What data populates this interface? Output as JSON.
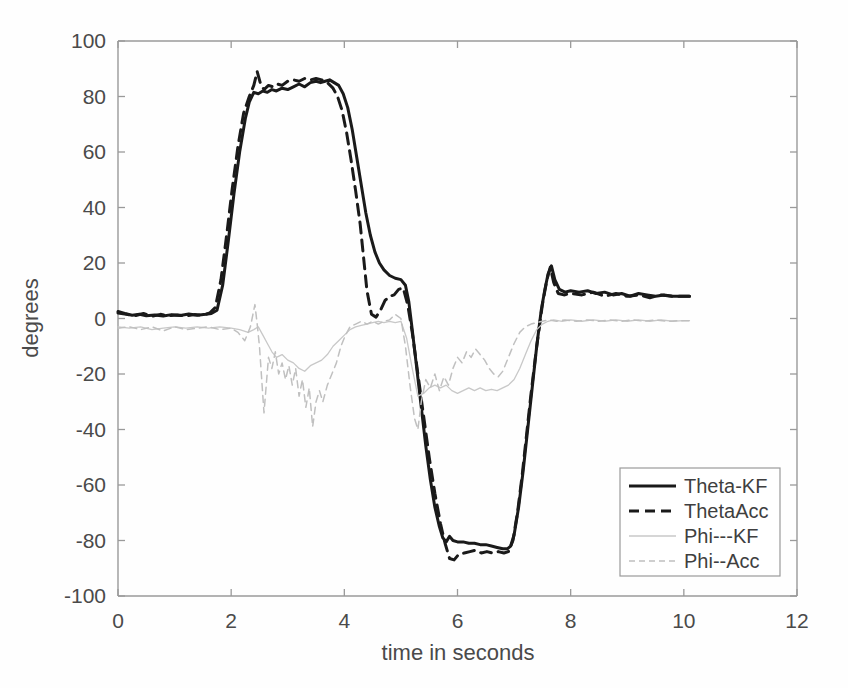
{
  "chart_data": {
    "type": "line",
    "title": "",
    "xlabel": "time in seconds",
    "ylabel": "degrees",
    "xlim": [
      0,
      12
    ],
    "ylim": [
      -100,
      100
    ],
    "xticks": [
      0,
      2,
      4,
      6,
      8,
      10,
      12
    ],
    "yticks": [
      -100,
      -80,
      -60,
      -40,
      -20,
      0,
      20,
      40,
      60,
      80,
      100
    ],
    "xtick_labels": [
      "0",
      "2",
      "4",
      "6",
      "8",
      "10",
      "12"
    ],
    "ytick_labels": [
      "-100",
      "-80",
      "-60",
      "-40",
      "-20",
      "0",
      "20",
      "40",
      "60",
      "80",
      "100"
    ],
    "grid": false,
    "legend_position": "lower right",
    "legend_entries": [
      {
        "label": "Theta-KF",
        "style": "solid",
        "color": "#1a1a1a",
        "width": 3.0
      },
      {
        "label": "ThetaAcc",
        "style": "dashed",
        "color": "#1a1a1a",
        "width": 3.0
      },
      {
        "label": "Phi---KF",
        "style": "solid",
        "color": "#c8c8c8",
        "width": 1.3
      },
      {
        "label": "Phi--Acc",
        "style": "dashed",
        "color": "#c0c0c0",
        "width": 1.5
      }
    ],
    "series": [
      {
        "name": "Theta-KF",
        "style": "solid",
        "color": "#1a1a1a",
        "width": 3.0,
        "x": [
          0.0,
          0.12,
          0.25,
          0.38,
          0.5,
          0.65,
          0.8,
          0.95,
          1.1,
          1.25,
          1.4,
          1.55,
          1.65,
          1.75,
          1.85,
          1.95,
          2.05,
          2.15,
          2.25,
          2.32,
          2.4,
          2.48,
          2.56,
          2.64,
          2.72,
          2.8,
          2.9,
          3.0,
          3.1,
          3.2,
          3.3,
          3.4,
          3.5,
          3.58,
          3.66,
          3.74,
          3.82,
          3.9,
          3.98,
          4.06,
          4.14,
          4.22,
          4.3,
          4.38,
          4.46,
          4.54,
          4.62,
          4.7,
          4.8,
          4.9,
          5.0,
          5.08,
          5.14,
          5.2,
          5.28,
          5.36,
          5.44,
          5.52,
          5.6,
          5.68,
          5.74,
          5.8,
          5.86,
          5.92,
          6.0,
          6.1,
          6.2,
          6.3,
          6.4,
          6.5,
          6.6,
          6.7,
          6.8,
          6.88,
          6.94,
          7.0,
          7.08,
          7.16,
          7.24,
          7.32,
          7.4,
          7.48,
          7.54,
          7.6,
          7.66,
          7.72,
          7.8,
          7.9,
          8.0,
          8.15,
          8.3,
          8.45,
          8.6,
          8.75,
          8.9,
          9.05,
          9.2,
          9.35,
          9.5,
          9.65,
          9.8,
          9.95,
          10.1
        ],
        "y": [
          2.5,
          1.8,
          1.2,
          1.5,
          1.0,
          1.3,
          0.9,
          1.4,
          1.1,
          1.6,
          1.2,
          1.5,
          1.8,
          3.0,
          12.0,
          28.0,
          45.0,
          60.0,
          72.0,
          78.0,
          81.5,
          81.0,
          82.0,
          81.5,
          82.5,
          82.0,
          83.0,
          82.5,
          83.5,
          84.5,
          83.5,
          85.0,
          85.5,
          85.0,
          85.5,
          86.0,
          85.0,
          84.0,
          81.0,
          76.0,
          68.0,
          58.0,
          48.0,
          38.0,
          30.0,
          24.0,
          20.0,
          17.5,
          15.5,
          14.5,
          14.0,
          12.0,
          6.0,
          -4.0,
          -18.0,
          -32.0,
          -46.0,
          -58.0,
          -68.0,
          -75.0,
          -79.0,
          -80.5,
          -78.5,
          -80.0,
          -80.5,
          -80.5,
          -81.0,
          -81.0,
          -81.5,
          -81.5,
          -82.0,
          -82.5,
          -83.0,
          -83.0,
          -82.0,
          -78.0,
          -68.0,
          -55.0,
          -40.0,
          -25.0,
          -10.0,
          3.0,
          10.0,
          16.0,
          19.0,
          14.0,
          10.5,
          9.5,
          10.0,
          9.5,
          10.0,
          9.0,
          9.5,
          8.5,
          9.0,
          8.0,
          9.0,
          8.5,
          8.0,
          8.5,
          8.0,
          8.0,
          8.0
        ]
      },
      {
        "name": "ThetaAcc",
        "style": "dashed",
        "color": "#1a1a1a",
        "width": 3.0,
        "x": [
          0.0,
          0.15,
          0.3,
          0.45,
          0.6,
          0.75,
          0.9,
          1.05,
          1.2,
          1.35,
          1.5,
          1.62,
          1.72,
          1.82,
          1.92,
          2.02,
          2.12,
          2.22,
          2.32,
          2.4,
          2.46,
          2.52,
          2.58,
          2.66,
          2.74,
          2.82,
          2.9,
          3.0,
          3.1,
          3.2,
          3.3,
          3.4,
          3.5,
          3.6,
          3.7,
          3.8,
          3.88,
          3.96,
          4.04,
          4.12,
          4.2,
          4.28,
          4.34,
          4.4,
          4.48,
          4.56,
          4.64,
          4.72,
          4.8,
          4.88,
          4.96,
          5.04,
          5.12,
          5.2,
          5.3,
          5.4,
          5.5,
          5.6,
          5.7,
          5.78,
          5.86,
          5.94,
          6.02,
          6.12,
          6.22,
          6.32,
          6.42,
          6.52,
          6.62,
          6.72,
          6.82,
          6.9,
          6.98,
          7.06,
          7.14,
          7.22,
          7.3,
          7.4,
          7.5,
          7.58,
          7.64,
          7.7,
          7.78,
          7.88,
          8.0,
          8.2,
          8.4,
          8.6,
          8.8,
          9.0,
          9.2,
          9.4,
          9.6,
          9.8,
          10.0,
          10.1
        ],
        "y": [
          2.0,
          1.5,
          1.0,
          1.8,
          0.8,
          1.5,
          1.0,
          1.3,
          0.9,
          1.4,
          1.2,
          2.0,
          4.0,
          14.0,
          30.0,
          47.0,
          62.0,
          74.0,
          80.0,
          84.0,
          89.0,
          84.5,
          82.5,
          84.0,
          83.5,
          84.5,
          84.0,
          85.5,
          86.0,
          85.5,
          86.5,
          86.0,
          86.5,
          86.0,
          85.0,
          83.0,
          80.0,
          75.0,
          67.0,
          57.0,
          46.0,
          34.0,
          22.0,
          10.0,
          1.5,
          0.5,
          3.0,
          6.5,
          8.0,
          8.5,
          10.5,
          11.0,
          5.0,
          -5.0,
          -20.0,
          -35.0,
          -50.0,
          -63.0,
          -74.0,
          -81.0,
          -86.5,
          -87.0,
          -85.0,
          -84.5,
          -84.0,
          -83.5,
          -84.5,
          -84.0,
          -84.5,
          -84.0,
          -84.5,
          -84.0,
          -80.0,
          -70.0,
          -57.0,
          -42.0,
          -27.0,
          -10.0,
          5.0,
          14.0,
          18.5,
          13.0,
          9.0,
          8.5,
          9.0,
          8.5,
          9.5,
          8.0,
          9.0,
          8.0,
          8.5,
          7.5,
          8.5,
          8.0,
          8.0,
          8.0
        ]
      },
      {
        "name": "Phi---KF",
        "style": "solid",
        "color": "#c8c8c8",
        "width": 1.3,
        "x": [
          0.0,
          0.2,
          0.4,
          0.6,
          0.8,
          1.0,
          1.2,
          1.4,
          1.6,
          1.8,
          2.0,
          2.15,
          2.3,
          2.4,
          2.48,
          2.56,
          2.64,
          2.72,
          2.8,
          2.9,
          3.0,
          3.1,
          3.2,
          3.3,
          3.4,
          3.5,
          3.6,
          3.7,
          3.8,
          3.9,
          4.0,
          4.1,
          4.2,
          4.3,
          4.4,
          4.5,
          4.6,
          4.7,
          4.8,
          4.9,
          5.0,
          5.1,
          5.2,
          5.3,
          5.4,
          5.5,
          5.6,
          5.7,
          5.8,
          5.9,
          6.0,
          6.1,
          6.2,
          6.3,
          6.4,
          6.5,
          6.6,
          6.7,
          6.8,
          6.9,
          7.0,
          7.1,
          7.2,
          7.3,
          7.4,
          7.5,
          7.6,
          7.7,
          7.85,
          8.0,
          8.2,
          8.4,
          8.6,
          8.8,
          9.0,
          9.2,
          9.4,
          9.6,
          9.8,
          10.0,
          10.1
        ],
        "y": [
          -3.0,
          -3.5,
          -3.0,
          -4.0,
          -3.5,
          -3.0,
          -3.5,
          -3.0,
          -3.5,
          -3.0,
          -3.5,
          -4.0,
          -5.0,
          -4.0,
          -3.0,
          -6.0,
          -9.0,
          -12.0,
          -14.0,
          -13.0,
          -15.0,
          -16.0,
          -18.0,
          -19.0,
          -17.0,
          -16.0,
          -15.0,
          -13.0,
          -10.0,
          -8.0,
          -6.0,
          -4.0,
          -3.0,
          -2.5,
          -2.0,
          -1.5,
          -1.0,
          -1.5,
          -1.0,
          -1.5,
          -1.0,
          -7.0,
          -18.0,
          -28.0,
          -27.0,
          -25.0,
          -24.0,
          -25.0,
          -24.0,
          -26.0,
          -27.0,
          -26.0,
          -25.0,
          -26.0,
          -25.0,
          -26.0,
          -25.5,
          -26.0,
          -25.0,
          -24.0,
          -22.0,
          -18.0,
          -13.0,
          -8.0,
          -4.0,
          -2.0,
          -1.0,
          -0.5,
          -1.0,
          -0.5,
          -1.0,
          -0.5,
          -1.0,
          -0.5,
          -1.0,
          -0.5,
          -1.0,
          -0.5,
          -1.0,
          -0.8,
          -0.8
        ]
      },
      {
        "name": "Phi--Acc",
        "style": "dashed",
        "color": "#c0c0c0",
        "width": 1.5,
        "x": [
          0.0,
          0.2,
          0.4,
          0.6,
          0.8,
          1.0,
          1.2,
          1.4,
          1.6,
          1.8,
          2.0,
          2.12,
          2.24,
          2.34,
          2.42,
          2.46,
          2.5,
          2.54,
          2.58,
          2.62,
          2.66,
          2.72,
          2.78,
          2.84,
          2.9,
          2.96,
          3.02,
          3.08,
          3.14,
          3.2,
          3.26,
          3.32,
          3.38,
          3.44,
          3.5,
          3.56,
          3.62,
          3.7,
          3.78,
          3.86,
          3.94,
          4.02,
          4.1,
          4.2,
          4.3,
          4.4,
          4.5,
          4.6,
          4.7,
          4.8,
          4.9,
          5.0,
          5.08,
          5.16,
          5.24,
          5.3,
          5.36,
          5.44,
          5.52,
          5.6,
          5.68,
          5.76,
          5.84,
          5.92,
          6.0,
          6.08,
          6.16,
          6.24,
          6.32,
          6.4,
          6.48,
          6.56,
          6.64,
          6.72,
          6.8,
          6.9,
          7.0,
          7.1,
          7.2,
          7.3,
          7.4,
          7.5,
          7.6,
          7.75,
          7.9,
          8.1,
          8.3,
          8.5,
          8.7,
          8.9,
          9.1,
          9.3,
          9.5,
          9.7,
          9.9,
          10.1
        ],
        "y": [
          -3.5,
          -3.0,
          -4.0,
          -3.0,
          -4.5,
          -3.0,
          -4.0,
          -3.5,
          -3.0,
          -4.0,
          -3.5,
          -5.0,
          -8.0,
          -3.0,
          5.0,
          -2.0,
          -10.0,
          -22.0,
          -34.0,
          -24.0,
          -14.0,
          -18.0,
          -12.0,
          -20.0,
          -16.0,
          -22.0,
          -17.0,
          -24.0,
          -18.0,
          -28.0,
          -22.0,
          -32.0,
          -25.0,
          -39.0,
          -30.0,
          -26.0,
          -30.0,
          -24.0,
          -20.0,
          -16.0,
          -10.0,
          -6.0,
          -3.0,
          -2.0,
          -1.0,
          -2.0,
          -1.0,
          -2.0,
          -1.0,
          -0.5,
          1.5,
          0.0,
          -10.0,
          -24.0,
          -36.0,
          -40.0,
          -30.0,
          -22.0,
          -25.0,
          -20.0,
          -26.0,
          -21.0,
          -24.0,
          -18.0,
          -14.0,
          -16.0,
          -12.0,
          -14.0,
          -11.0,
          -13.0,
          -15.0,
          -18.0,
          -20.0,
          -21.0,
          -19.0,
          -14.0,
          -9.0,
          -5.0,
          -3.0,
          -2.0,
          -1.5,
          -1.0,
          -0.5,
          -1.0,
          -0.5,
          -1.0,
          -0.5,
          -1.0,
          -0.5,
          -1.0,
          -0.5,
          -1.0,
          -0.5,
          -1.0,
          -0.8,
          -0.8
        ]
      }
    ]
  },
  "figure": {
    "background": "#ffffff",
    "axis_color": "#9a9a9a",
    "text_color": "#4a4a4a"
  }
}
